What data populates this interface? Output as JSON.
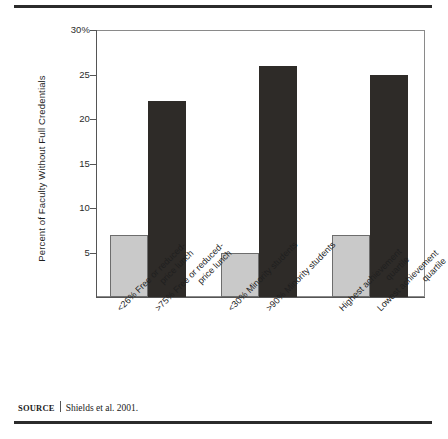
{
  "figure": {
    "source_label": "SOURCE",
    "source_text": "Shields et al. 2001."
  },
  "chart_data": {
    "type": "bar",
    "title": "",
    "xlabel": "",
    "ylabel": "Percent of Faculty Without Full Credentials",
    "ylim": [
      0,
      30
    ],
    "yticks": [
      "5",
      "10",
      "15",
      "20",
      "25",
      "30%"
    ],
    "ytick_values": [
      5,
      10,
      15,
      20,
      25,
      30
    ],
    "grid": false,
    "legend": "none",
    "categories": [
      "<26% Free or reduced-price lunch",
      ">75% Free or reduced-price lunch",
      "<30% Minority students",
      ">90% Minority students",
      "Highest achievement quartile",
      "Lowest achievement quartile"
    ],
    "category_lines": [
      [
        "<26% Free or reduced-",
        "price lunch"
      ],
      [
        ">75%  Free or reduced-",
        "price lunch"
      ],
      [
        "<30% Minority students",
        ""
      ],
      [
        ">90% Minority students",
        ""
      ],
      [
        "Highest achievement",
        "quartile"
      ],
      [
        "Lowest achievement",
        "quartile"
      ]
    ],
    "values": [
      7,
      22,
      5,
      26,
      7,
      25
    ],
    "bar_colors": [
      "#c9c9c9",
      "#2e2b28",
      "#c9c9c9",
      "#2e2b28",
      "#c9c9c9",
      "#2e2b28"
    ],
    "colors": {
      "light_bar": "#c9c9c9",
      "dark_bar": "#2e2b28",
      "axis": "#555555",
      "rule": "#2b2b2b"
    }
  }
}
